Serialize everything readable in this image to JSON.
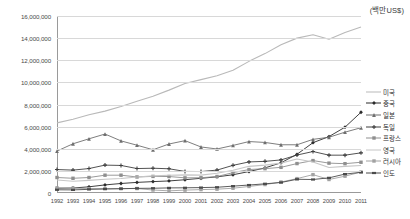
{
  "unit_label": "(백만US$)",
  "legend": {
    "position": "right",
    "items": [
      {
        "label": "미국",
        "color": "#b9b9b9",
        "marker": "none"
      },
      {
        "label": "중국",
        "color": "#2b2b2b",
        "marker": "diamond"
      },
      {
        "label": "일본",
        "color": "#6f6f6f",
        "marker": "triangle"
      },
      {
        "label": "독일",
        "color": "#3f3f3f",
        "marker": "cross"
      },
      {
        "label": "프랑스",
        "color": "#8f8f8f",
        "marker": "square"
      },
      {
        "label": "영국",
        "color": "#c6c6c6",
        "marker": "none"
      },
      {
        "label": "러시아",
        "color": "#a2a2a2",
        "marker": "square"
      },
      {
        "label": "인도",
        "color": "#4a4a4a",
        "marker": "bar"
      }
    ]
  },
  "chart_data": {
    "type": "line",
    "title": "",
    "xlabel": "",
    "ylabel": "",
    "unit": "백만US$",
    "grid": true,
    "ylim": [
      0,
      16000000
    ],
    "yticks": [
      0,
      2000000,
      4000000,
      6000000,
      8000000,
      10000000,
      12000000,
      14000000,
      16000000
    ],
    "ytick_labels": [
      "0",
      "2,000,000",
      "4,000,000",
      "6,000,000",
      "8,000,000",
      "10,000,000",
      "12,000,000",
      "14,000,000",
      "16,000,000"
    ],
    "categories": [
      1992,
      1993,
      1994,
      1995,
      1996,
      1997,
      1998,
      1999,
      2000,
      2001,
      2002,
      2003,
      2004,
      2005,
      2006,
      2007,
      2008,
      2009,
      2010,
      2011
    ],
    "xtick_labels": [
      "1992",
      "1993",
      "1994",
      "1995",
      "1996",
      "1997",
      "1998",
      "1999",
      "2000",
      "2001",
      "2002",
      "2003",
      "2004",
      "2005",
      "2006",
      "2007",
      "2008",
      "2009",
      "2010",
      "2011"
    ],
    "series": [
      {
        "name": "미국",
        "color": "#b9b9b9",
        "marker": "none",
        "values": [
          6340000,
          6670000,
          7070000,
          7400000,
          7820000,
          8300000,
          8750000,
          9300000,
          9900000,
          10250000,
          10600000,
          11100000,
          11900000,
          12600000,
          13400000,
          14000000,
          14300000,
          13900000,
          14500000,
          15000000
        ]
      },
      {
        "name": "중국",
        "color": "#2b2b2b",
        "marker": "diamond",
        "values": [
          430000,
          450000,
          560000,
          730000,
          860000,
          960000,
          1030000,
          1090000,
          1200000,
          1330000,
          1460000,
          1650000,
          1940000,
          2270000,
          2730000,
          3500000,
          4550000,
          5100000,
          5950000,
          7300000
        ]
      },
      {
        "name": "일본",
        "color": "#6f6f6f",
        "marker": "triangle",
        "values": [
          3790000,
          4450000,
          4900000,
          5330000,
          4710000,
          4320000,
          3910000,
          4430000,
          4730000,
          4160000,
          3980000,
          4300000,
          4650000,
          4570000,
          4360000,
          4360000,
          4850000,
          5040000,
          5500000,
          5900000
        ]
      },
      {
        "name": "독일",
        "color": "#3f3f3f",
        "marker": "cross",
        "values": [
          2120000,
          2070000,
          2210000,
          2520000,
          2490000,
          2210000,
          2240000,
          2190000,
          1950000,
          1940000,
          2070000,
          2500000,
          2810000,
          2860000,
          2990000,
          3430000,
          3750000,
          3420000,
          3420000,
          3630000
        ]
      },
      {
        "name": "프랑스",
        "color": "#8f8f8f",
        "marker": "square",
        "values": [
          1400000,
          1330000,
          1400000,
          1610000,
          1610000,
          1450000,
          1500000,
          1490000,
          1370000,
          1380000,
          1490000,
          1840000,
          2120000,
          2200000,
          2320000,
          2660000,
          2930000,
          2700000,
          2650000,
          2780000
        ]
      },
      {
        "name": "영국",
        "color": "#c6c6c6",
        "marker": "none",
        "values": [
          1180000,
          1060000,
          1140000,
          1240000,
          1310000,
          1440000,
          1550000,
          1610000,
          1640000,
          1620000,
          1780000,
          2050000,
          2410000,
          2520000,
          2700000,
          3070000,
          2800000,
          2310000,
          2410000,
          2480000
        ]
      },
      {
        "name": "러시아",
        "color": "#a2a2a2",
        "marker": "square",
        "values": [
          460000,
          435000,
          395000,
          395000,
          391000,
          404000,
          270000,
          196000,
          260000,
          307000,
          345000,
          430000,
          591000,
          764000,
          990000,
          1300000,
          1660000,
          1220000,
          1520000,
          1900000
        ]
      },
      {
        "name": "인도",
        "color": "#4a4a4a",
        "marker": "bar",
        "values": [
          290000,
          280000,
          330000,
          360000,
          390000,
          420000,
          430000,
          460000,
          470000,
          490000,
          520000,
          620000,
          720000,
          830000,
          950000,
          1240000,
          1220000,
          1370000,
          1710000,
          1870000
        ]
      }
    ]
  }
}
